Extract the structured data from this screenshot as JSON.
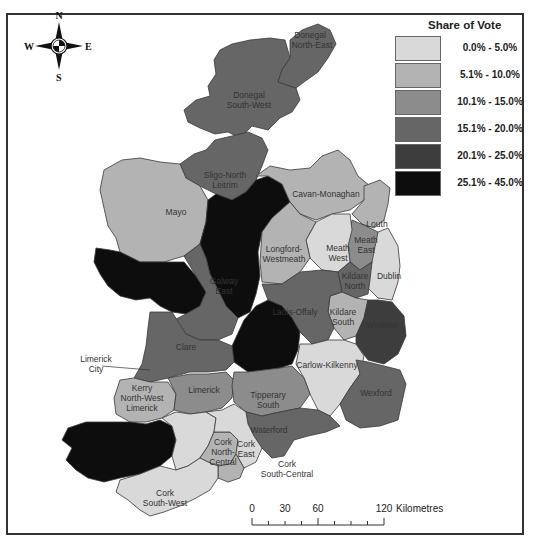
{
  "legend": {
    "title": "Share of Vote",
    "classes": [
      {
        "label": "0.0% - 5.0%",
        "color": "#d9d9d9"
      },
      {
        "label": "5.1% - 10.0%",
        "color": "#b3b3b3"
      },
      {
        "label": "10.1% - 15.0%",
        "color": "#8c8c8c"
      },
      {
        "label": "15.1% - 20.0%",
        "color": "#666666"
      },
      {
        "label": "20.1% - 25.0%",
        "color": "#3d3d3d"
      },
      {
        "label": "25.1% - 45.0%",
        "color": "#0d0d0d"
      }
    ]
  },
  "compass": {
    "n": "N",
    "s": "S",
    "e": "E",
    "w": "W"
  },
  "scale_bar": {
    "ticks": [
      "0",
      "30",
      "60",
      "120"
    ],
    "unit": "Kilometres"
  },
  "constituencies": [
    {
      "name": "Donegal North-East",
      "label_lines": [
        "Donegal",
        "North-East"
      ],
      "class": "15.1% - 20.0%"
    },
    {
      "name": "Donegal South-West",
      "label_lines": [
        "Donegal",
        "South-West"
      ],
      "class": "15.1% - 20.0%"
    },
    {
      "name": "Sligo-North Leitrim",
      "label_lines": [
        "Sligo-North",
        "Leitrim"
      ],
      "class": "15.1% - 20.0%"
    },
    {
      "name": "Cavan-Monaghan",
      "label_lines": [
        "Cavan-Monaghan"
      ],
      "class": "5.1% - 10.0%"
    },
    {
      "name": "Mayo",
      "label_lines": [
        "Mayo"
      ],
      "class": "5.1% - 10.0%"
    },
    {
      "name": "Roscommon-South Leitrim",
      "label_lines": [],
      "class": "25.1% - 45.0%"
    },
    {
      "name": "Louth",
      "label_lines": [
        "Louth"
      ],
      "class": "5.1% - 10.0%"
    },
    {
      "name": "Meath East",
      "label_lines": [
        "Meath",
        "East"
      ],
      "class": "10.1% - 15.0%"
    },
    {
      "name": "Meath West",
      "label_lines": [
        "Meath",
        "West"
      ],
      "class": "0.0% - 5.0%"
    },
    {
      "name": "Longford-Westmeath",
      "label_lines": [
        "Longford-",
        "Westmeath"
      ],
      "class": "5.1% - 10.0%"
    },
    {
      "name": "Galway West",
      "label_lines": [],
      "class": "25.1% - 45.0%"
    },
    {
      "name": "Galway East",
      "label_lines": [
        "Galway",
        "East"
      ],
      "class": "15.1% - 20.0%"
    },
    {
      "name": "Kildare North",
      "label_lines": [
        "Kildare",
        "North"
      ],
      "class": "15.1% - 20.0%"
    },
    {
      "name": "Dublin",
      "label_lines": [
        "Dublin"
      ],
      "class": "0.0% - 5.0%"
    },
    {
      "name": "Laois-Offaly",
      "label_lines": [
        "Laois-Offaly"
      ],
      "class": "15.1% - 20.0%"
    },
    {
      "name": "Kildare South",
      "label_lines": [
        "Kildare",
        "South"
      ],
      "class": "5.1% - 10.0%"
    },
    {
      "name": "Wicklow",
      "label_lines": [
        "Wicklow"
      ],
      "class": "20.1% - 25.0%"
    },
    {
      "name": "Clare",
      "label_lines": [
        "Clare"
      ],
      "class": "15.1% - 20.0%"
    },
    {
      "name": "Tipperary North",
      "label_lines": [],
      "class": "25.1% - 45.0%"
    },
    {
      "name": "Limerick City",
      "label_lines": [
        "Limerick",
        "City"
      ],
      "class": "15.1% - 20.0%"
    },
    {
      "name": "Carlow-Kilkenny",
      "label_lines": [
        "Carlow-Kilkenny"
      ],
      "class": "0.0% - 5.0%"
    },
    {
      "name": "Kerry North-West Limerick",
      "label_lines": [
        "Kerry",
        "North-West",
        "Limerick"
      ],
      "class": "5.1% - 10.0%"
    },
    {
      "name": "Limerick",
      "label_lines": [
        "Limerick"
      ],
      "class": "10.1% - 15.0%"
    },
    {
      "name": "Tipperary South",
      "label_lines": [
        "Tipperary",
        "South"
      ],
      "class": "10.1% - 15.0%"
    },
    {
      "name": "Wexford",
      "label_lines": [
        "Wexford"
      ],
      "class": "15.1% - 20.0%"
    },
    {
      "name": "Waterford",
      "label_lines": [
        "Waterford"
      ],
      "class": "15.1% - 20.0%"
    },
    {
      "name": "Kerry South",
      "label_lines": [],
      "class": "25.1% - 45.0%"
    },
    {
      "name": "Cork North-West",
      "label_lines": [
        "Cork",
        "North-",
        "West"
      ],
      "class": "0.0% - 5.0%"
    },
    {
      "name": "Cork North-Central",
      "label_lines": [
        "Cork",
        "North-",
        "Central"
      ],
      "class": "5.1% - 10.0%"
    },
    {
      "name": "Cork East",
      "label_lines": [
        "Cork",
        "East"
      ],
      "class": "0.0% - 5.0%"
    },
    {
      "name": "Cork South-Central",
      "label_lines": [
        "Cork",
        "South-Central"
      ],
      "class": "5.1% - 10.0%"
    },
    {
      "name": "Cork South-West",
      "label_lines": [
        "Cork",
        "South-West"
      ],
      "class": "0.0% - 5.0%"
    }
  ]
}
